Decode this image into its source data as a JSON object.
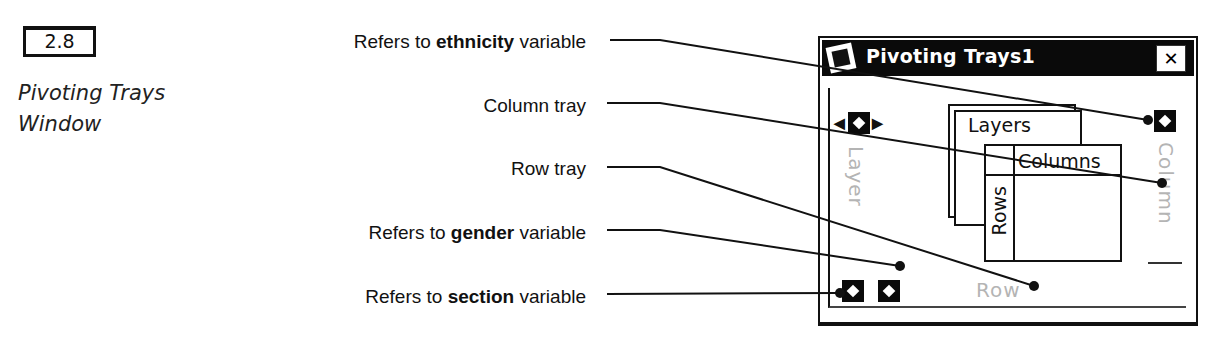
{
  "figure": {
    "number": "2.8",
    "caption_line1": "Pivoting Trays",
    "caption_line2": "Window"
  },
  "callouts": [
    {
      "prefix": "Refers to ",
      "bold": "ethnicity",
      "suffix": " variable"
    },
    {
      "prefix": "",
      "bold": "",
      "suffix": "Column tray"
    },
    {
      "prefix": "",
      "bold": "",
      "suffix": "Row tray"
    },
    {
      "prefix": "Refers to ",
      "bold": "gender",
      "suffix": " variable"
    },
    {
      "prefix": "Refers to ",
      "bold": "section",
      "suffix": " variable"
    }
  ],
  "window": {
    "title": "Pivoting Trays1",
    "close_glyph": "✕",
    "layer_tray_label": "Layer",
    "column_tray_label": "Column",
    "row_tray_label": "Row",
    "diagram": {
      "layers_label": "Layers",
      "columns_label": "Columns",
      "rows_label": "Rows"
    },
    "arrows": {
      "left": "◀",
      "right": "▶"
    }
  }
}
